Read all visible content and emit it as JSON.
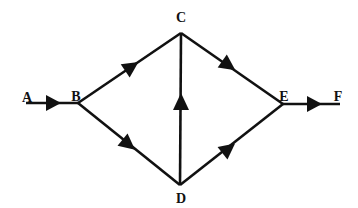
{
  "nodes": [
    {
      "id": "A",
      "label": "A",
      "x": 26,
      "y": 103,
      "lx": 27,
      "ly": 102
    },
    {
      "id": "B",
      "label": "B",
      "x": 78,
      "y": 103,
      "lx": 76,
      "ly": 101
    },
    {
      "id": "C",
      "label": "C",
      "x": 181,
      "y": 33,
      "lx": 181,
      "ly": 22
    },
    {
      "id": "D",
      "label": "D",
      "x": 180,
      "y": 185,
      "lx": 181,
      "ly": 203
    },
    {
      "id": "E",
      "label": "E",
      "x": 283,
      "y": 104,
      "lx": 284,
      "ly": 101
    },
    {
      "id": "F",
      "label": "F",
      "x": 340,
      "y": 104,
      "lx": 338,
      "ly": 101
    }
  ],
  "edges": [
    {
      "from": "A",
      "to": "B",
      "direction": "A->B"
    },
    {
      "from": "B",
      "to": "C",
      "direction": "B->C"
    },
    {
      "from": "B",
      "to": "D",
      "direction": "B->D"
    },
    {
      "from": "D",
      "to": "C",
      "direction": "D->C"
    },
    {
      "from": "C",
      "to": "E",
      "direction": "C->E"
    },
    {
      "from": "D",
      "to": "E",
      "direction": "D->E"
    },
    {
      "from": "E",
      "to": "F",
      "direction": "E->F"
    }
  ],
  "colors": {
    "line": "#111111",
    "background": "#ffffff"
  }
}
